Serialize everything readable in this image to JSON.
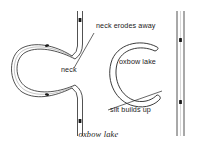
{
  "figure": {
    "caption": "oxbow lake",
    "background_color": "#ffffff",
    "line_color": "#262626",
    "marker_color": "#1a1a1a"
  },
  "annotations": {
    "neck_erodes_away": "neck erodes away",
    "neck": "neck",
    "oxbow_lake": "oxbow lake",
    "silt_builds_up": "silt builds up"
  },
  "diagram": {
    "type": "river-meander-oxbow-formation",
    "panels": [
      {
        "name": "before",
        "description": "Meandering river with large loop and narrow neck",
        "features": [
          "vertical-channel",
          "meander-loop",
          "narrow-neck",
          "flow-markers"
        ]
      },
      {
        "name": "after",
        "description": "Straightened river channel with detached C-shaped oxbow lake",
        "features": [
          "vertical-channel",
          "oxbow-lake-crescent",
          "silt-plugs",
          "flow-markers"
        ]
      }
    ],
    "flow_marker_count": 7
  }
}
